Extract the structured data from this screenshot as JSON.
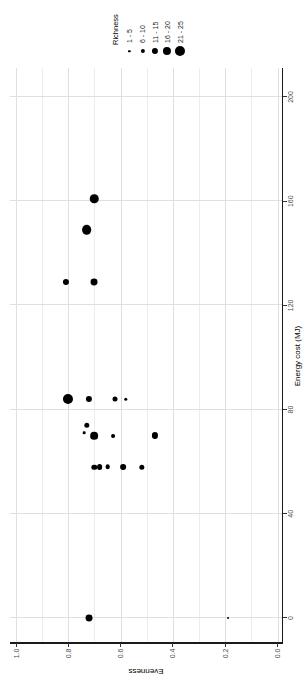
{
  "colors": {
    "point": "#000000",
    "grid_major": "#dfdfdf",
    "grid_minor": "#ededed",
    "axis_line": "#1a1a1a",
    "tick_label": "#4d4d4d",
    "title_text": "#000000",
    "background": "#ffffff"
  },
  "chart_data": {
    "type": "scatter",
    "title": "",
    "xlabel": "Energy cost (MJ)",
    "ylabel": "Evenness",
    "xlim": [
      -10,
      211
    ],
    "ylim": [
      -0.02,
      1.02
    ],
    "x_ticks": [
      0,
      40,
      80,
      120,
      160,
      200
    ],
    "y_ticks": [
      "1.0",
      "0.8",
      "0.6",
      "0.4",
      "0.2",
      "0.0"
    ],
    "y_minor_step": 0.1,
    "grid": "on",
    "orientation": "rotated-90-ccw",
    "legend": {
      "title": "Richness",
      "position": "right",
      "entries": [
        {
          "label": "1 - 5",
          "rep_value": 3
        },
        {
          "label": "6 - 10",
          "rep_value": 8
        },
        {
          "label": "11 - 15",
          "rep_value": 13
        },
        {
          "label": "16 - 20",
          "rep_value": 18
        },
        {
          "label": "21 - 25",
          "rep_value": 23
        }
      ]
    },
    "size_encoding": "bubble diameter = richness class",
    "points": [
      {
        "energy": 161,
        "evenness": 0.7,
        "richness": 19
      },
      {
        "energy": 149,
        "evenness": 0.73,
        "richness": 22
      },
      {
        "energy": 129,
        "evenness": 0.81,
        "richness": 13
      },
      {
        "energy": 129,
        "evenness": 0.7,
        "richness": 15
      },
      {
        "energy": 84,
        "evenness": 0.8,
        "richness": 23
      },
      {
        "energy": 84,
        "evenness": 0.72,
        "richness": 13
      },
      {
        "energy": 84,
        "evenness": 0.62,
        "richness": 10
      },
      {
        "energy": 84,
        "evenness": 0.58,
        "richness": 6
      },
      {
        "energy": 74,
        "evenness": 0.73,
        "richness": 11
      },
      {
        "energy": 71,
        "evenness": 0.74,
        "richness": 4
      },
      {
        "energy": 70,
        "evenness": 0.7,
        "richness": 17
      },
      {
        "energy": 70,
        "evenness": 0.63,
        "richness": 7
      },
      {
        "energy": 70,
        "evenness": 0.47,
        "richness": 13
      },
      {
        "energy": 58,
        "evenness": 0.7,
        "richness": 11
      },
      {
        "energy": 58,
        "evenness": 0.68,
        "richness": 12
      },
      {
        "energy": 58,
        "evenness": 0.65,
        "richness": 9
      },
      {
        "energy": 58,
        "evenness": 0.59,
        "richness": 12
      },
      {
        "energy": 58,
        "evenness": 0.52,
        "richness": 11
      },
      {
        "energy": 0,
        "evenness": 0.72,
        "richness": 15
      },
      {
        "energy": 0,
        "evenness": 0.19,
        "richness": 2
      }
    ]
  }
}
